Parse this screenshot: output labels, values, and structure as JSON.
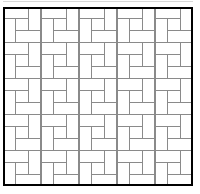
{
  "figure": {
    "name": "pinwheel-tiling-diagram",
    "caption_fragment": "",
    "frame": {
      "x": 3,
      "y": 7,
      "width": 190,
      "height": 179,
      "border_color": "#000000",
      "border_width": 2,
      "fill_color": "#ffffff"
    },
    "tiling": {
      "type": "pinwheel",
      "tile_shape": "rectangle",
      "tile_aspect_ratio": "2:1",
      "blocks_across": 5,
      "blocks_down": 5,
      "tiles_per_block": 4,
      "center_square_per_block": true,
      "total_tiles": 100,
      "line_color": "#8a8a8a",
      "line_width": 1.1,
      "tile_fill": "#ffffff"
    },
    "colors": {
      "background": "#ffffff",
      "outer_border": "#000000",
      "inner_lines": "#8a8a8a",
      "faint_rule": "#d8d8d8"
    }
  }
}
